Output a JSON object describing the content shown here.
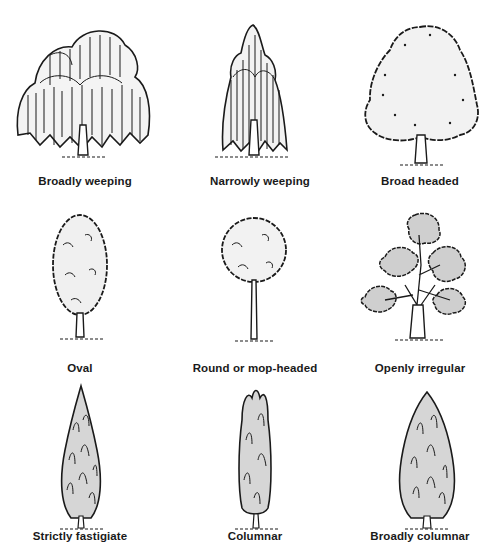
{
  "figure": {
    "rows": [
      {
        "items": [
          {
            "label": "Broadly weeping",
            "shape": "broadly-weeping"
          },
          {
            "label": "Narrowly weeping",
            "shape": "narrowly-weeping"
          },
          {
            "label": "Broad headed",
            "shape": "broad-headed"
          }
        ]
      },
      {
        "items": [
          {
            "label": "Oval",
            "shape": "oval"
          },
          {
            "label": "Round or mop-headed",
            "shape": "round-mop-headed"
          },
          {
            "label": "Openly irregular",
            "shape": "openly-irregular"
          }
        ]
      },
      {
        "items": [
          {
            "label": "Strictly fastigiate",
            "shape": "strictly-fastigiate"
          },
          {
            "label": "Columnar",
            "shape": "columnar"
          },
          {
            "label": "Broadly columnar",
            "shape": "broadly-columnar"
          }
        ]
      }
    ],
    "colors": {
      "ink": "#1a1a1a",
      "crown_fill_light": "#efefef",
      "crown_fill_grey": "#cfcfcf",
      "background": "#ffffff"
    }
  }
}
